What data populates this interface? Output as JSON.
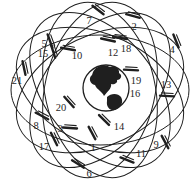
{
  "figure": {
    "width": 194,
    "height": 189,
    "background_color": "#ffffff",
    "line_color": "#1f1f1f",
    "text_color": "#1f1f1f",
    "label_font_size": 10.5
  },
  "constellation": {
    "center_x": 100,
    "center_y": 90,
    "orbit_semi_major": 89,
    "orbit_semi_minor": 55,
    "orbit_stroke_width": 1,
    "plane_rotations_deg": [
      0,
      25.7,
      51.4,
      77.1,
      102.9,
      128.6,
      154.3
    ]
  },
  "earth": {
    "cx": 106,
    "cy": 88,
    "r": 23,
    "outline_width": 1.3,
    "fill": "#ffffff",
    "continents": [
      {
        "name": "north-america",
        "path": "M 93,72 C 96,66 104,64 110,67 C 115,65 120,69 119,73 C 123,75 121,80 117,80 C 118,83 114,85 111,84 C 112,88 108,91 104,96 C 102,91 97,90 95,85 C 90,84 88,78 92,75 Z"
      },
      {
        "name": "south-america",
        "path": "M 107,97 C 111,93 118,93 121,97 C 124,102 121,108 115,110 C 110,111 106,107 107,101 Z"
      }
    ]
  },
  "satellites": [
    {
      "id": "1",
      "label_x": 93,
      "label_y": 147,
      "marker_x": 92,
      "marker_y": 133,
      "marker_angle": 62
    },
    {
      "id": "2",
      "label_x": 134,
      "label_y": 26,
      "marker_x": 133,
      "marker_y": 16,
      "marker_angle": 15
    },
    {
      "id": "3",
      "label_x": 60,
      "label_y": 128,
      "marker_x": 70,
      "marker_y": 128,
      "marker_angle": 4
    },
    {
      "id": "4",
      "label_x": 172,
      "label_y": 49,
      "marker_x": 176,
      "marker_y": 41,
      "marker_angle": 68
    },
    {
      "id": "5",
      "label_x": 44,
      "label_y": 43,
      "marker_x": 50,
      "marker_y": 41,
      "marker_angle": 70
    },
    {
      "id": "6",
      "label_x": 89,
      "label_y": 173,
      "marker_x": 78,
      "marker_y": 164,
      "marker_angle": 32
    },
    {
      "id": "7",
      "label_x": 89,
      "label_y": 20,
      "marker_x": 98,
      "marker_y": 10,
      "marker_angle": 38
    },
    {
      "id": "8",
      "label_x": 36,
      "label_y": 125,
      "marker_x": 42,
      "marker_y": 116,
      "marker_angle": 28
    },
    {
      "id": "9",
      "label_x": 156,
      "label_y": 144,
      "marker_x": 165,
      "marker_y": 142,
      "marker_angle": 62
    },
    {
      "id": "10",
      "label_x": 77,
      "label_y": 55,
      "marker_x": 68,
      "marker_y": 49,
      "marker_angle": 10
    },
    {
      "id": "11",
      "label_x": 141,
      "label_y": 153,
      "marker_x": 127,
      "marker_y": 160,
      "marker_angle": 22
    },
    {
      "id": "12",
      "label_x": 113,
      "label_y": 52,
      "marker_x": 108,
      "marker_y": 40,
      "marker_angle": 12
    },
    {
      "id": "13",
      "label_x": 166,
      "label_y": 84,
      "marker_x": 167,
      "marker_y": 96,
      "marker_angle": 3
    },
    {
      "id": "14",
      "label_x": 119,
      "label_y": 126,
      "marker_x": 104,
      "marker_y": 120,
      "marker_angle": 45
    },
    {
      "id": "15",
      "label_x": 43,
      "label_y": 53,
      "marker_x": 53,
      "marker_y": 51,
      "marker_angle": 72
    },
    {
      "id": "16",
      "label_x": 135,
      "label_y": 93,
      "marker_x": null,
      "marker_y": null,
      "marker_angle": 0
    },
    {
      "id": "17",
      "label_x": 44,
      "label_y": 146,
      "marker_x": 54,
      "marker_y": 139,
      "marker_angle": 64
    },
    {
      "id": "18",
      "label_x": 126,
      "label_y": 48,
      "marker_x": 120,
      "marker_y": 38,
      "marker_angle": 8
    },
    {
      "id": "19",
      "label_x": 136,
      "label_y": 80,
      "marker_x": 131,
      "marker_y": 70,
      "marker_angle": 3
    },
    {
      "id": "20",
      "label_x": 61,
      "label_y": 107,
      "marker_x": 69,
      "marker_y": 102,
      "marker_angle": 48
    },
    {
      "id": "21",
      "label_x": 17,
      "label_y": 80,
      "marker_x": 24,
      "marker_y": 68,
      "marker_angle": 78
    }
  ]
}
